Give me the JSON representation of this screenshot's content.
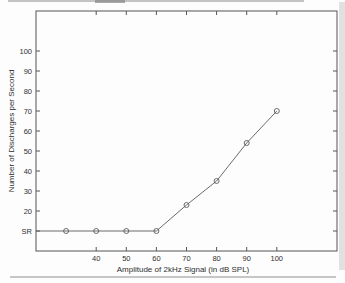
{
  "chart_data": {
    "type": "line",
    "title": "",
    "xlabel": "Amplitude of 2kHz Signal (in dB SPL)",
    "ylabel": "Number of Discharges per Second",
    "x": [
      30,
      40,
      50,
      60,
      70,
      80,
      90,
      100
    ],
    "y": [
      10,
      10,
      10,
      10,
      23,
      35,
      54,
      70
    ],
    "xlim": [
      20,
      120
    ],
    "ylim": [
      0,
      120
    ],
    "xticks": {
      "values": [
        40,
        50,
        60,
        70,
        80,
        90,
        100
      ],
      "labels": [
        "40",
        "50",
        "60",
        "70",
        "80",
        "90",
        "100"
      ]
    },
    "yticks": {
      "values": [
        10,
        20,
        30,
        40,
        50,
        60,
        70,
        80,
        90,
        100
      ],
      "labels": [
        "SR",
        "20",
        "30",
        "40",
        "50",
        "60",
        "70",
        "80",
        "90",
        "100"
      ]
    },
    "grid": "off",
    "legend": "none",
    "marker": "circle-open",
    "line_extends_to_left_axis": true,
    "axis_color": "#555555",
    "line_color": "#5a5a5a",
    "text_color": "#2f2f2f"
  }
}
